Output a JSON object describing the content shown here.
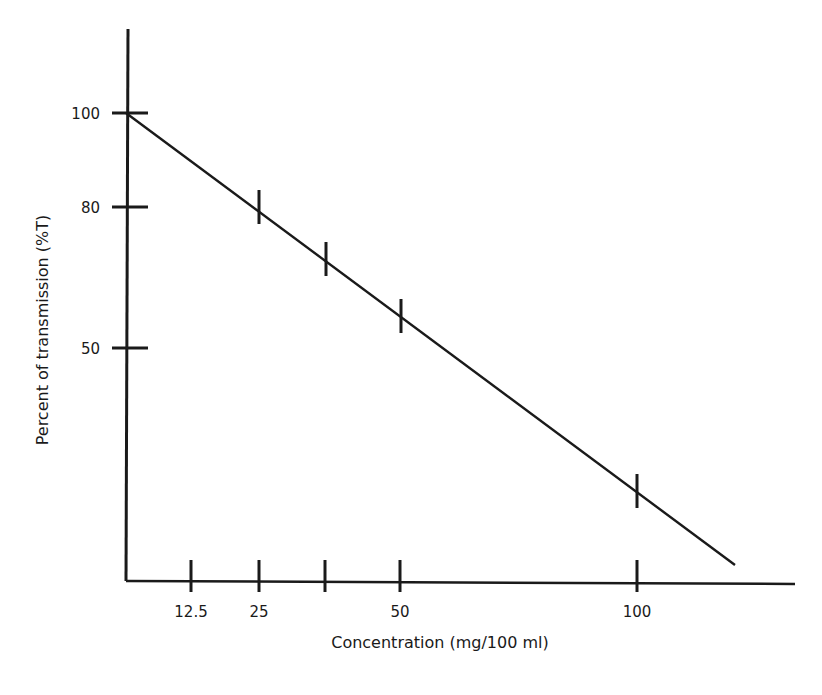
{
  "chart_data": {
    "type": "line",
    "title": "",
    "xlabel": "Concentration (mg/100 ml)",
    "ylabel": "Percent of transmission (%T)",
    "x_ticks": [
      {
        "value": 12.5,
        "label": "12.5",
        "px": 191
      },
      {
        "value": 25,
        "label": "25",
        "px": 259
      },
      {
        "value": 37.5,
        "label": "",
        "px": 325
      },
      {
        "value": 50,
        "label": "50",
        "px": 400
      },
      {
        "value": 100,
        "label": "100",
        "px": 637
      }
    ],
    "y_ticks": [
      {
        "value": 100,
        "label": "100",
        "py": 113
      },
      {
        "value": 80,
        "label": "80",
        "py": 207
      },
      {
        "value": 50,
        "label": "50",
        "py": 348
      }
    ],
    "y_scale": "log",
    "grid": false,
    "legend": null,
    "series": [
      {
        "name": "%T vs concentration",
        "points": [
          {
            "x": 0,
            "y": 100,
            "px": 126,
            "py": 113
          },
          {
            "x": 25,
            "y": 80,
            "px": 259,
            "py": 207
          },
          {
            "x": 37.5,
            "y": 70,
            "px": 326,
            "py": 259
          },
          {
            "x": 50,
            "y": 60,
            "px": 401,
            "py": 316
          },
          {
            "x": 100,
            "y": 33,
            "px": 637,
            "py": 491
          }
        ],
        "line_end": {
          "px": 735,
          "py": 565
        }
      }
    ]
  },
  "axes": {
    "origin": {
      "px": 126,
      "py": 581
    },
    "y_top": 29,
    "x_right": 795
  }
}
